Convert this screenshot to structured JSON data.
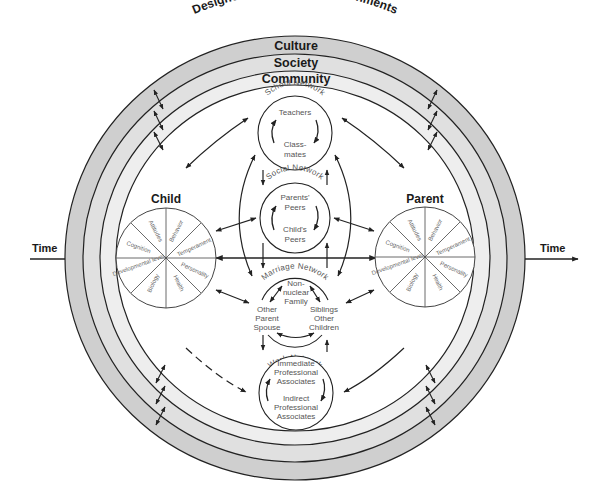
{
  "diagram": {
    "environment_label": "Designed and Natural Environments",
    "rings": [
      {
        "label": "Culture",
        "fill": "#cfcfcf"
      },
      {
        "label": "Society",
        "fill": "#e0e0e0"
      },
      {
        "label": "Community",
        "fill": "#eeeeee"
      }
    ],
    "time": {
      "left_label": "Time",
      "right_label": "Time"
    },
    "child": {
      "title": "Child",
      "segments": [
        "Attitudes",
        "Behavior",
        "Temperament",
        "Personality",
        "Health",
        "Biology",
        "Developmental level",
        "Cognition"
      ]
    },
    "parent": {
      "title": "Parent",
      "segments": [
        "Attitudes",
        "Behavior",
        "Temperament",
        "Personality",
        "Health",
        "Biology",
        "Developmental level",
        "Cognition"
      ]
    },
    "networks": {
      "school": {
        "title": "School Network",
        "top": "Teachers",
        "bottom_1": "Class-",
        "bottom_2": "mates"
      },
      "social": {
        "title": "Social Network",
        "top_1": "Parents'",
        "top_2": "Peers",
        "bottom_1": "Child's",
        "bottom_2": "Peers"
      },
      "marriage": {
        "title": "Marriage Network",
        "top_1": "Non-",
        "top_2": "nuclear",
        "top_3": "Family",
        "left_1": "Other",
        "left_2": "Parent",
        "left_3": "Spouse",
        "right_1": "Siblings",
        "right_2": "Other",
        "right_3": "Children"
      },
      "work": {
        "title": "Work Network",
        "top_1": "Immediate",
        "top_2": "Professional",
        "top_3": "Associates",
        "bottom_1": "Indirect",
        "bottom_2": "Professional",
        "bottom_3": "Associates"
      }
    },
    "colors": {
      "line": "#222222",
      "outer_ring": "#cfcfcf",
      "middle_ring": "#e0e0e0",
      "inner_ring": "#eeeeee",
      "background": "#ffffff"
    }
  }
}
